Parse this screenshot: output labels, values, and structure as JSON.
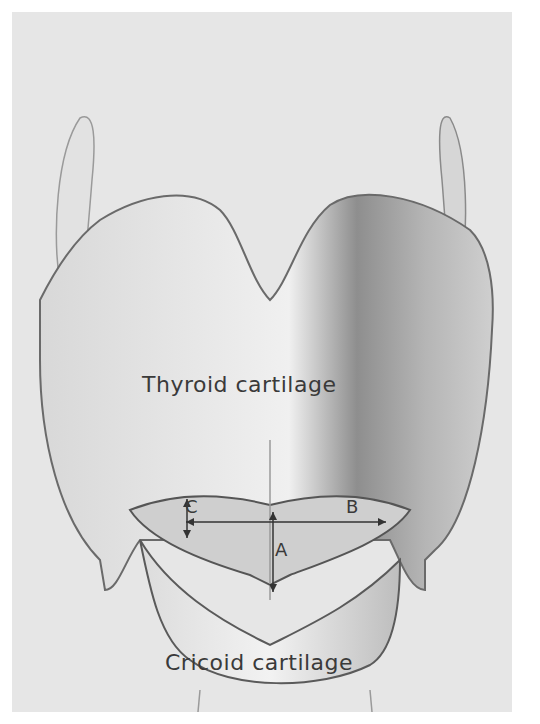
{
  "figure": {
    "background": "#e6e6e6",
    "labels": {
      "thyroid": "Thyroid cartilage",
      "cricoid": "Cricoid cartilage",
      "a": "A",
      "b": "B",
      "c": "C"
    },
    "measurements": [
      {
        "id": "A",
        "orientation": "vertical",
        "description": "anteroposterior dimension"
      },
      {
        "id": "B",
        "orientation": "horizontal",
        "description": "transverse dimension"
      },
      {
        "id": "C",
        "orientation": "vertical",
        "description": "lateral dimension"
      }
    ]
  }
}
